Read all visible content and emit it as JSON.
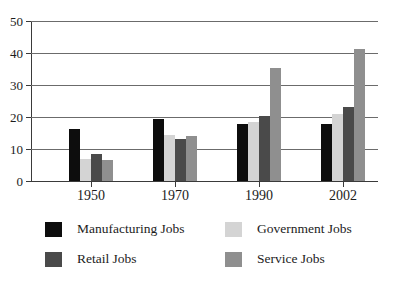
{
  "chart_data": {
    "type": "bar",
    "title": "",
    "subtitle": "",
    "xlabel": "",
    "ylabel": "",
    "categories": [
      "1950",
      "1970",
      "1990",
      "2002"
    ],
    "ylim": [
      0,
      50
    ],
    "yticks": [
      "0",
      "10",
      "20",
      "30",
      "40",
      "50"
    ],
    "grid": true,
    "legend_position": "bottom",
    "series": [
      {
        "name": "Manufacturing Jobs",
        "color": "#0d0d0d",
        "values": [
          16.3,
          19.4,
          17.8,
          17.8
        ]
      },
      {
        "name": "Government Jobs",
        "color": "#d4d4d4",
        "values": [
          7.0,
          14.5,
          18.3,
          21.0
        ]
      },
      {
        "name": "Retail Jobs",
        "color": "#4a4a4a",
        "values": [
          8.4,
          13.0,
          20.3,
          23.2
        ]
      },
      {
        "name": "Service Jobs",
        "color": "#8f8f8f",
        "values": [
          6.5,
          14.0,
          35.3,
          41.3
        ]
      }
    ]
  },
  "legend": {
    "order": [
      "Manufacturing Jobs",
      "Government Jobs",
      "Retail Jobs",
      "Service Jobs"
    ]
  }
}
